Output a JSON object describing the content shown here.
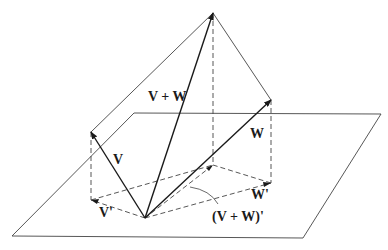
{
  "figure": {
    "type": "vector projection diagram",
    "labels": {
      "v": "V",
      "w": "W",
      "v_plus_w": "V + W",
      "v_proj": "V'",
      "w_proj": "W'",
      "sum_proj": "(V + W)'"
    },
    "colors": {
      "line": "#333333",
      "vector": "#1a1a1a",
      "background": "#ffffff"
    }
  }
}
